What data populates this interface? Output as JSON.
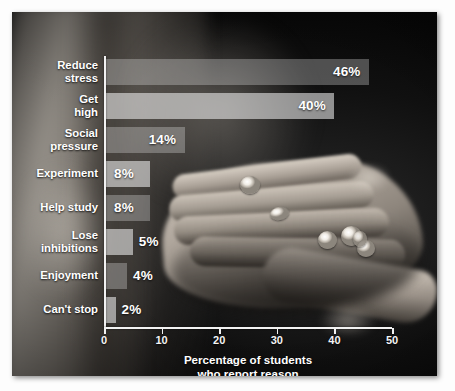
{
  "chart_data": {
    "type": "bar",
    "orientation": "horizontal",
    "title": "",
    "xlabel": "Percentage of students\nwho report reason",
    "ylabel": "",
    "xlim": [
      0,
      50
    ],
    "xticks": [
      0,
      10,
      20,
      30,
      40,
      50
    ],
    "grid": false,
    "legend": null,
    "categories": [
      "Reduce\nstress",
      "Get\nhigh",
      "Social\npressure",
      "Experiment",
      "Help study",
      "Lose\ninhibitions",
      "Enjoyment",
      "Can't stop"
    ],
    "values": [
      46,
      40,
      14,
      8,
      8,
      5,
      4,
      2
    ],
    "value_labels": [
      "46%",
      "40%",
      "14%",
      "8%",
      "8%",
      "5%",
      "4%",
      "2%"
    ]
  },
  "axis": {
    "tick_labels": [
      "0",
      "10",
      "20",
      "30",
      "40",
      "50"
    ],
    "title": "Percentage of students\nwho report reason"
  },
  "colors": {
    "bar_dark": "#ececec",
    "bar_light": "#f4f4f4",
    "text": "#ffffff",
    "axis": "#f2f2f2",
    "background": "#050505",
    "page": "#fdfdfd"
  },
  "background_image": {
    "description": "grayscale photograph of an open upturned hand holding several white pills",
    "subject": "hand-with-pills"
  }
}
